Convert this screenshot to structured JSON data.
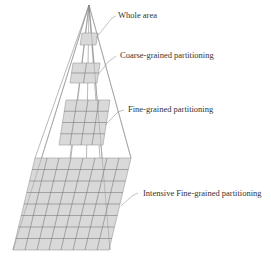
{
  "diagram": {
    "type": "hierarchical-partitioning-pyramid",
    "apex": "top",
    "levels": [
      {
        "label": "Whole area",
        "grid": 1
      },
      {
        "label": "Coarse-grained partitioning",
        "grid": 2
      },
      {
        "label": "Fine-grained partitioning",
        "grid": 4
      },
      {
        "label": "Intensive Fine-grained partitioning",
        "grid": 8
      }
    ]
  },
  "colors": {
    "plane_fill": "#d9d9d9",
    "grid_lines": "#7a7a7a",
    "text": "#333333"
  }
}
